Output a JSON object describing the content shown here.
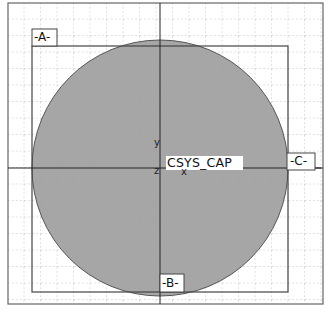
{
  "drawing": {
    "frame": {
      "x": 8,
      "y": 3,
      "w": 315,
      "h": 301
    },
    "inner_rect": {
      "x": 32,
      "y": 46,
      "w": 256,
      "h": 246
    },
    "circle": {
      "cx": 160,
      "cy": 168,
      "r": 128,
      "fill": "#a6a6a6"
    },
    "grid": {
      "spacing": 16.5,
      "color": "#9a9a9a"
    },
    "axes": {
      "center_x": 160,
      "center_y": 168
    }
  },
  "labels": {
    "view_a": "-A-",
    "view_b": "-B-",
    "view_c": "-C-",
    "csys": "CSYS_CAP",
    "axis_y": "y",
    "axis_z": "z",
    "axis_x": "x"
  }
}
